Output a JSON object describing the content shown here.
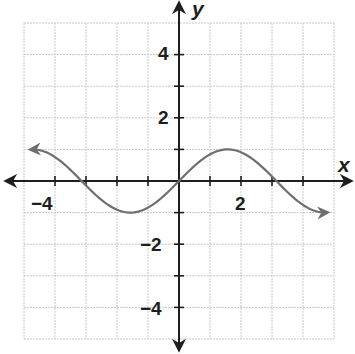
{
  "chart_data": {
    "type": "line",
    "title": "",
    "xlabel": "x",
    "ylabel": "y",
    "xlim": [
      -5,
      5
    ],
    "ylim": [
      -5,
      5
    ],
    "grid": true,
    "grid_step": 1,
    "x_tick_labels": [
      {
        "value": -4,
        "label": "−4"
      },
      {
        "value": 2,
        "label": "2"
      }
    ],
    "y_tick_labels": [
      {
        "value": 4,
        "label": "4"
      },
      {
        "value": 2,
        "label": "2"
      },
      {
        "value": -2,
        "label": "−2"
      },
      {
        "value": -4,
        "label": "−4"
      }
    ],
    "series": [
      {
        "name": "y = sin(x)",
        "function": "sin(x)",
        "domain_shown": [
          -4.8,
          4.8
        ],
        "arrows_at_ends": true,
        "color": "#6e6e6e",
        "x": [
          -4.8,
          -4.0,
          -3.14,
          -2.0,
          -1.57,
          -1.0,
          0,
          1.0,
          1.57,
          2.0,
          3.14,
          4.0,
          4.8
        ],
        "values": [
          1.0,
          0.76,
          0,
          -0.91,
          -1.0,
          -0.84,
          0,
          0.84,
          1.0,
          0.91,
          0,
          -0.76,
          -1.0
        ]
      }
    ],
    "key_points": {
      "zeros": [
        -3.14,
        0,
        3.14
      ],
      "maximum": {
        "x": 1.57,
        "y": 1
      },
      "minimum": {
        "x": -1.57,
        "y": -1
      }
    }
  },
  "labels": {
    "x_axis": "x",
    "y_axis": "y",
    "xtick_neg4": "−4",
    "xtick_2": "2",
    "ytick_4": "4",
    "ytick_2": "2",
    "ytick_neg2": "−2",
    "ytick_neg4": "−4"
  },
  "colors": {
    "axis": "#1e1e1e",
    "grid": "#c8c8c8",
    "curve": "#6e6e6e"
  }
}
